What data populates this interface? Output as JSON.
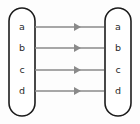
{
  "diagram": {
    "type": "bipartite-arrow-diagram",
    "background_color": "#fdfdfd",
    "outline_color": "#1c1c1c",
    "arrow_color": "#8a8a8a",
    "label_color": "#2a2a2a",
    "domain_set": {
      "name": "left-set",
      "shape": "stadium",
      "x": 9,
      "y": 8,
      "width": 26,
      "height": 108,
      "elements": [
        {
          "label": "a",
          "cx": 22,
          "cy": 27
        },
        {
          "label": "b",
          "cx": 22,
          "cy": 48
        },
        {
          "label": "c",
          "cx": 22,
          "cy": 70
        },
        {
          "label": "d",
          "cx": 22,
          "cy": 91
        }
      ]
    },
    "codomain_set": {
      "name": "right-set",
      "shape": "stadium",
      "x": 105,
      "y": 8,
      "width": 26,
      "height": 108,
      "elements": [
        {
          "label": "a",
          "cx": 118,
          "cy": 27
        },
        {
          "label": "b",
          "cx": 118,
          "cy": 48
        },
        {
          "label": "c",
          "cx": 118,
          "cy": 70
        },
        {
          "label": "d",
          "cx": 118,
          "cy": 91
        }
      ]
    },
    "arrows": [
      {
        "from": "a",
        "to": "a",
        "x1": 35,
        "x2": 104,
        "y": 27,
        "head_x": 74
      },
      {
        "from": "b",
        "to": "b",
        "x1": 35,
        "x2": 104,
        "y": 48,
        "head_x": 74
      },
      {
        "from": "c",
        "to": "c",
        "x1": 35,
        "x2": 104,
        "y": 70,
        "head_x": 74
      },
      {
        "from": "d",
        "to": "d",
        "x1": 35,
        "x2": 104,
        "y": 91,
        "head_x": 74
      }
    ]
  }
}
